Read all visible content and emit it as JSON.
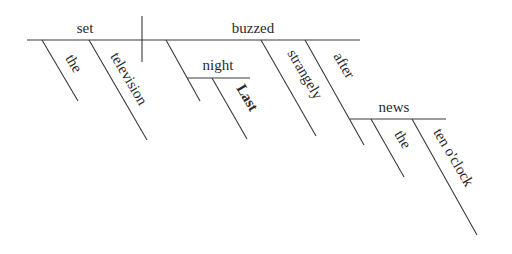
{
  "diagram": {
    "type": "sentence-diagram",
    "sentence": "Last night the television set buzzed strangely after the ten o'clock news",
    "colors": {
      "line": "#3a3a3a",
      "text": "#2a2a2a",
      "background": "#ffffff"
    },
    "baseline": {
      "subject": "set",
      "verb": "buzzed"
    },
    "modifiers": {
      "subject": [
        {
          "word": "the",
          "role": "article"
        },
        {
          "word": "television",
          "role": "adjective"
        }
      ],
      "verb": [
        {
          "word": "night",
          "role": "adverbial noun"
        },
        {
          "word": "Last",
          "role": "adjective of night"
        },
        {
          "word": "strangely",
          "role": "adverb"
        },
        {
          "word": "after",
          "role": "preposition"
        }
      ],
      "prepositional_object": {
        "word": "news",
        "modifiers": [
          {
            "word": "the",
            "role": "article"
          },
          {
            "word": "ten o'clock",
            "role": "adjective"
          }
        ]
      }
    }
  }
}
